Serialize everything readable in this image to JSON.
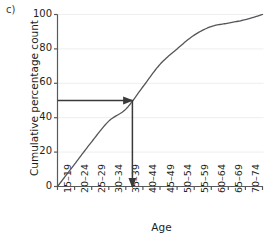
{
  "panel": {
    "label": "c)"
  },
  "chart_data": {
    "type": "line",
    "title": "",
    "subtitle": "",
    "xlabel": "Age",
    "ylabel": "Cumulative percentage count",
    "categories": [
      "15–19",
      "20–24",
      "25–29",
      "30–34",
      "35–39",
      "40–44",
      "45–49",
      "50–54",
      "55–59",
      "60–64",
      "65–69",
      "70–74",
      "75–79"
    ],
    "values": [
      0,
      13,
      26,
      38,
      45,
      58,
      71,
      80,
      88,
      93,
      95,
      97,
      100
    ],
    "ylim": [
      0,
      100
    ],
    "yticks": [
      0,
      20,
      40,
      60,
      80,
      100
    ],
    "ytick_labels": [
      "0",
      "20",
      "40",
      "60",
      "80",
      "100"
    ],
    "grid": "horizontal",
    "legend": "none",
    "series_color": "#55565a",
    "annotations": {
      "median_value": 50,
      "median_category": "35–39",
      "horizontal_arrow": {
        "from_x": "0",
        "to_x": "35–39",
        "y": 50
      },
      "vertical_arrow": {
        "x": "35–39",
        "from_y": 50,
        "to_y": 0
      },
      "arrow_color": "#3a3a3a"
    }
  },
  "colors": {
    "background": "#ffffff",
    "axis": "#58595b",
    "gridline": "#eeeeee",
    "text": "#231f20",
    "curve": "#55565a",
    "annotation": "#3a3a3a"
  }
}
